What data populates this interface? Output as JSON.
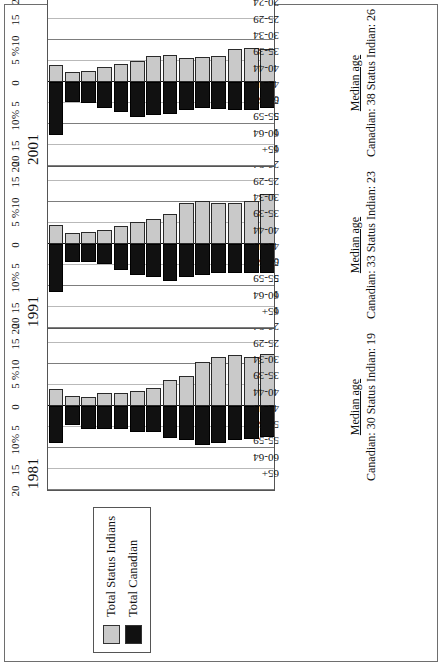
{
  "figure": {
    "orientation": "rotated-90-ccw",
    "legend": {
      "title": "",
      "items": [
        {
          "label": "Total Status Indians",
          "color": "#c9c9c9",
          "swatch_name": "legend-swatch-status-indians"
        },
        {
          "label": "Total Canadian",
          "color": "#111111",
          "swatch_name": "legend-swatch-total-canadian"
        }
      ]
    },
    "axis": {
      "pct_symbol": "%",
      "tick_labels": [
        "20",
        "15",
        "10",
        "5",
        "0",
        "5",
        "10",
        "15",
        "20"
      ],
      "tick_values": [
        -20,
        -15,
        -10,
        -5,
        0,
        5,
        10,
        15,
        20
      ]
    },
    "median_heading": "Median age"
  },
  "chart_data": {
    "type": "bar",
    "subtype": "population-pyramid",
    "title": "",
    "xlabel": "%",
    "ylabel": "",
    "xlim": [
      -20,
      20
    ],
    "grid": true,
    "legend_position": "top-left",
    "categories": [
      "65+",
      "60-64",
      "55-59",
      "50-54",
      "45-49",
      "40-44",
      "35-39",
      "30-34",
      "25-29",
      "20-24",
      "15-19",
      "10-14",
      "5-9",
      "0-4"
    ],
    "panels": [
      {
        "year": "1981",
        "median_age": {
          "label": "Median age",
          "canadian_label": "Canadian:",
          "canadian": "30",
          "status_indian_label": "Status Indian:",
          "status_indian": "19"
        },
        "series": [
          {
            "name": "Total Status Indians",
            "side": "right",
            "color": "#c9c9c9",
            "values": [
              4.1,
              2.3,
              2.2,
              3.0,
              3.1,
              3.6,
              4.3,
              6.1,
              7.1,
              10.4,
              11.6,
              12.2,
              11.6,
              12.3
            ]
          },
          {
            "name": "Total Canadian",
            "side": "left",
            "color": "#111111",
            "values": [
              8.8,
              4.6,
              5.4,
              5.5,
              5.5,
              6.1,
              6.2,
              7.6,
              8.0,
              9.3,
              8.9,
              8.0,
              7.8,
              7.4
            ]
          }
        ]
      },
      {
        "year": "1991",
        "median_age": {
          "label": "Median age",
          "canadian_label": "Canadian:",
          "canadian": "33",
          "status_indian_label": "Status Indian:",
          "status_indian": "23"
        },
        "series": [
          {
            "name": "Total Status Indians",
            "side": "right",
            "color": "#c9c9c9",
            "values": [
              4.6,
              2.6,
              2.8,
              3.3,
              4.3,
              5.2,
              6.0,
              7.2,
              9.7,
              10.2,
              9.7,
              9.7,
              10.2,
              12.0
            ]
          },
          {
            "name": "Total Canadian",
            "side": "left",
            "color": "#111111",
            "values": [
              11.4,
              4.2,
              4.3,
              4.7,
              6.3,
              7.3,
              7.8,
              8.8,
              7.8,
              7.4,
              6.9,
              6.8,
              6.8,
              6.9
            ]
          }
        ]
      },
      {
        "year": "2001",
        "median_age": {
          "label": "Median age",
          "canadian_label": "Canadian:",
          "canadian": "38",
          "status_indian_label": "Status Indian:",
          "status_indian": "26"
        },
        "series": [
          {
            "name": "Total Status Indians",
            "side": "right",
            "color": "#c9c9c9",
            "values": [
              4.0,
              2.3,
              2.6,
              3.6,
              4.3,
              5.0,
              6.1,
              6.4,
              5.8,
              6.0,
              6.3,
              7.9,
              8.2,
              7.9
            ]
          },
          {
            "name": "Total Canadian",
            "side": "left",
            "color": "#111111",
            "values": [
              12.6,
              4.7,
              5.1,
              6.2,
              7.2,
              8.3,
              7.8,
              7.6,
              6.6,
              6.2,
              6.4,
              6.6,
              6.6,
              6.2
            ]
          }
        ]
      }
    ]
  }
}
